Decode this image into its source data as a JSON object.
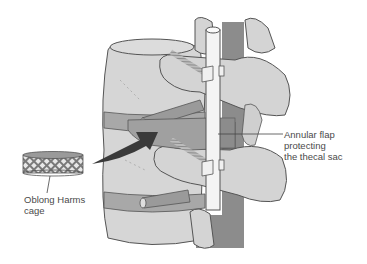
{
  "figure": {
    "type": "anatomical-illustration",
    "colors": {
      "background": "#ffffff",
      "bone": "#d4d4d4",
      "bone_outline": "#555555",
      "disc": "#a8a8a8",
      "thecal_sac": "#8c8c8c",
      "rod": "#f4f4f4",
      "arrow": "#3a3a3a",
      "label_text": "#4a4a4a"
    },
    "elements": [
      {
        "name": "vertebral-body",
        "description": "Stacked vertebral bodies"
      },
      {
        "name": "rod",
        "description": "Vertical posterior fixation rod"
      },
      {
        "name": "pedicle-screws",
        "description": "Two threaded screws with clamps"
      },
      {
        "name": "thecal-sac",
        "description": "Dark vertical band behind rod"
      },
      {
        "name": "nerve-roots",
        "description": "Cylindrical roots exiting laterally"
      },
      {
        "name": "insertion-arrow",
        "description": "Curved dark arrow from cage to disc space"
      },
      {
        "name": "harms-cage",
        "description": "Cross-hatched oblong mesh cylinder"
      }
    ]
  },
  "labels": {
    "annular": {
      "lines": [
        "Annular flap",
        "protecting",
        "the thecal sac"
      ]
    },
    "cage": {
      "lines": [
        "Oblong Harms",
        "cage"
      ]
    }
  }
}
